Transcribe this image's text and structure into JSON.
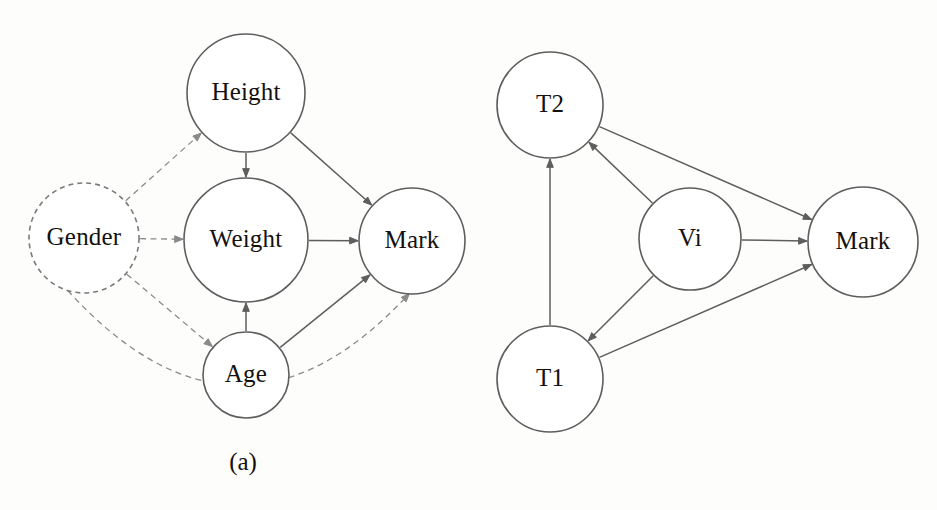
{
  "figure": {
    "background_color": "#fdfdfc",
    "stroke_color": "#5e5e5e",
    "dashed_stroke_color": "#8a8a8a",
    "text_color": "#14110f"
  },
  "panels": [
    {
      "id": "a",
      "caption": "(a)",
      "nodes": [
        {
          "id": "height",
          "label": "Height",
          "cx": 246,
          "cy": 93,
          "r": 59,
          "style": "solid"
        },
        {
          "id": "gender",
          "label": "Gender",
          "cx": 84,
          "cy": 238,
          "r": 55,
          "style": "dashed"
        },
        {
          "id": "weight",
          "label": "Weight",
          "cx": 246,
          "cy": 240,
          "r": 62,
          "style": "solid"
        },
        {
          "id": "mark",
          "label": "Mark",
          "cx": 412,
          "cy": 241,
          "r": 53,
          "style": "solid"
        },
        {
          "id": "age",
          "label": "Age",
          "cx": 246,
          "cy": 375,
          "r": 43,
          "style": "solid"
        }
      ],
      "edges": [
        {
          "from": "gender",
          "to": "height",
          "style": "dashed",
          "shape": "straight"
        },
        {
          "from": "gender",
          "to": "weight",
          "style": "dashed",
          "shape": "straight"
        },
        {
          "from": "gender",
          "to": "age",
          "style": "dashed",
          "shape": "straight"
        },
        {
          "from": "gender",
          "to": "mark",
          "style": "dashed",
          "shape": "curved"
        },
        {
          "from": "height",
          "to": "weight",
          "style": "solid",
          "shape": "straight"
        },
        {
          "from": "height",
          "to": "mark",
          "style": "solid",
          "shape": "straight"
        },
        {
          "from": "weight",
          "to": "mark",
          "style": "solid",
          "shape": "straight"
        },
        {
          "from": "age",
          "to": "weight",
          "style": "solid",
          "shape": "straight"
        },
        {
          "from": "age",
          "to": "mark",
          "style": "solid",
          "shape": "straight"
        }
      ]
    },
    {
      "id": "b",
      "caption": "(b)",
      "nodes": [
        {
          "id": "t2",
          "label": "T2",
          "cx": 80,
          "cy": 105,
          "r": 53,
          "style": "solid"
        },
        {
          "id": "t1",
          "label": "T1",
          "cx": 80,
          "cy": 379,
          "r": 53,
          "style": "solid"
        },
        {
          "id": "vi",
          "label": "Vi",
          "cx": 220,
          "cy": 239,
          "r": 51,
          "style": "solid"
        },
        {
          "id": "mark",
          "label": "Mark",
          "cx": 393,
          "cy": 242,
          "r": 55,
          "style": "solid"
        }
      ],
      "edges": [
        {
          "from": "t1",
          "to": "t2",
          "style": "solid",
          "shape": "straight"
        },
        {
          "from": "vi",
          "to": "t2",
          "style": "solid",
          "shape": "straight"
        },
        {
          "from": "vi",
          "to": "t1",
          "style": "solid",
          "shape": "straight"
        },
        {
          "from": "vi",
          "to": "mark",
          "style": "solid",
          "shape": "straight"
        },
        {
          "from": "t2",
          "to": "mark",
          "style": "solid",
          "shape": "straight"
        },
        {
          "from": "t1",
          "to": "mark",
          "style": "solid",
          "shape": "straight"
        }
      ]
    }
  ]
}
